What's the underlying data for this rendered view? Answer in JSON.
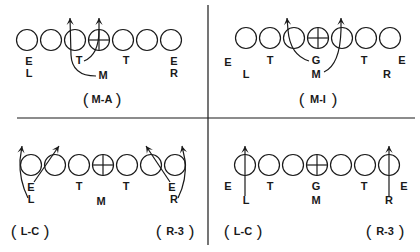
{
  "figure": {
    "type": "football-play-diagrams",
    "ink_color": "#1a1a1a",
    "background": "#ffffff"
  },
  "panels": [
    {
      "id": "top-left",
      "captions": [
        {
          "text": "M-A",
          "x": 102,
          "y": 104
        }
      ],
      "line_y": 40,
      "circle_xs": [
        27,
        51,
        75,
        99,
        123,
        147,
        171
      ],
      "center_index": 3,
      "labels": [
        {
          "text": "E",
          "x": 29,
          "y": 65
        },
        {
          "text": "L",
          "x": 29,
          "y": 77
        },
        {
          "text": "T",
          "x": 79,
          "y": 64
        },
        {
          "text": "M",
          "x": 103,
          "y": 79
        },
        {
          "text": "T",
          "x": 126,
          "y": 64
        },
        {
          "text": "E",
          "x": 174,
          "y": 65
        },
        {
          "text": "R",
          "x": 174,
          "y": 77
        }
      ],
      "routes": [
        {
          "from": "M",
          "d": "M 96 76 Q 72 76 71 55 L 70 18"
        },
        {
          "from": "T",
          "d": "M 84 61 Q 99 55 99 30 L 99 18"
        }
      ]
    },
    {
      "id": "top-right",
      "captions": [
        {
          "text": "M-I",
          "x": 318,
          "y": 104
        }
      ],
      "line_y": 38,
      "circle_xs": [
        246,
        270,
        294,
        318,
        342,
        366,
        390
      ],
      "center_index": 3,
      "labels": [
        {
          "text": "E",
          "x": 228,
          "y": 66
        },
        {
          "text": "L",
          "x": 246,
          "y": 78
        },
        {
          "text": "T",
          "x": 270,
          "y": 64
        },
        {
          "text": "G",
          "x": 316,
          "y": 64
        },
        {
          "text": "M",
          "x": 316,
          "y": 78
        },
        {
          "text": "T",
          "x": 364,
          "y": 64
        },
        {
          "text": "R",
          "x": 387,
          "y": 78
        },
        {
          "text": "E",
          "x": 402,
          "y": 64
        }
      ],
      "routes": [
        {
          "from": "G",
          "d": "M 309 61 Q 290 55 288 30 L 287 18"
        },
        {
          "from": "M",
          "d": "M 324 72 Q 340 65 341 30 L 341 18"
        }
      ]
    },
    {
      "id": "bottom-left",
      "captions": [
        {
          "text": "L-C",
          "x": 30,
          "y": 236
        },
        {
          "text": "R-3",
          "x": 175,
          "y": 236
        }
      ],
      "line_y": 165,
      "circle_xs": [
        31,
        55,
        79,
        103,
        127,
        151,
        175
      ],
      "center_index": 3,
      "labels": [
        {
          "text": "E",
          "x": 31,
          "y": 191
        },
        {
          "text": "L",
          "x": 31,
          "y": 203
        },
        {
          "text": "T",
          "x": 79,
          "y": 190
        },
        {
          "text": "M",
          "x": 101,
          "y": 205
        },
        {
          "text": "T",
          "x": 126,
          "y": 190
        },
        {
          "text": "E",
          "x": 172,
          "y": 191
        },
        {
          "text": "R",
          "x": 174,
          "y": 203
        }
      ],
      "routes": [
        {
          "from": "L",
          "d": "M 28 198 Q 19 180 20 160 L 22 146"
        },
        {
          "from": "E",
          "d": "M 34 182 L 59 146"
        },
        {
          "from": "E-right",
          "d": "M 170 182 L 146 146"
        },
        {
          "from": "R",
          "d": "M 178 198 Q 187 180 185 160 L 182 146"
        }
      ]
    },
    {
      "id": "bottom-right",
      "captions": [
        {
          "text": "L-C",
          "x": 243,
          "y": 236
        },
        {
          "text": "R-3",
          "x": 385,
          "y": 236
        }
      ],
      "line_y": 165,
      "circle_xs": [
        245,
        269,
        293,
        317,
        341,
        365,
        389
      ],
      "center_index": 3,
      "labels": [
        {
          "text": "E",
          "x": 228,
          "y": 190
        },
        {
          "text": "L",
          "x": 246,
          "y": 204
        },
        {
          "text": "T",
          "x": 270,
          "y": 190
        },
        {
          "text": "G",
          "x": 316,
          "y": 190
        },
        {
          "text": "M",
          "x": 316,
          "y": 204
        },
        {
          "text": "T",
          "x": 364,
          "y": 190
        },
        {
          "text": "R",
          "x": 389,
          "y": 204
        },
        {
          "text": "E",
          "x": 404,
          "y": 190
        }
      ],
      "routes": [
        {
          "from": "L",
          "d": "M 245 196 L 245 146"
        },
        {
          "from": "R",
          "d": "M 389 196 L 389 146"
        }
      ]
    }
  ],
  "dividers": {
    "vertical": {
      "x": 208,
      "y1": 5,
      "y2": 245
    },
    "horizontal": {
      "y": 118,
      "x1": 17,
      "x2": 415
    }
  }
}
